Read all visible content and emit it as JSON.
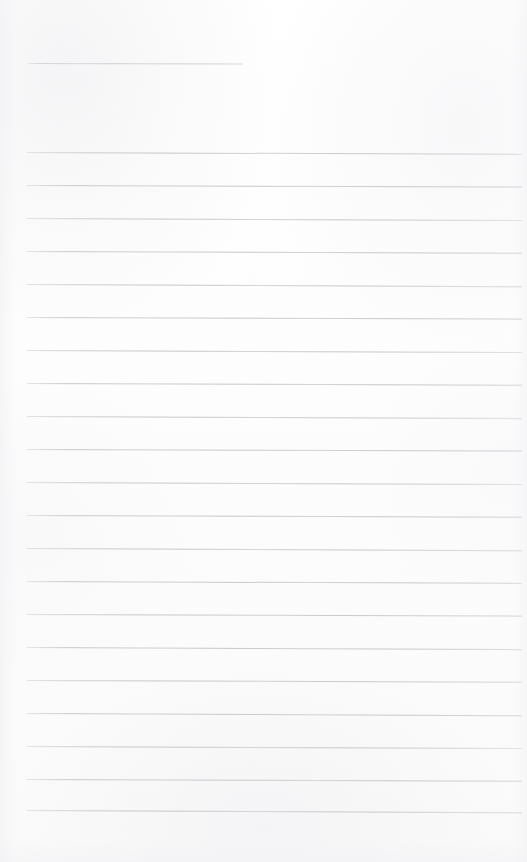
{
  "document": {
    "kind": "scanned-ruled-notepaper",
    "page_width": 527,
    "page_height": 862,
    "background_color": "#fdfdfd",
    "rule_color": "#c6c6cb",
    "text_content": "",
    "visible_text_lines": [],
    "notes": "Blank ruled page; no handwriting, printing, headings, numbers or marks of any kind are present."
  },
  "layout": {
    "left_margin_x": 27,
    "right_edge_x": 522,
    "first_rule_y": 152,
    "last_rule_y": 810,
    "rule_spacing": 32.9,
    "rule_thickness": 1,
    "top_blank_margin": 63,
    "bottom_blank_margin": 52
  },
  "rules": [
    {
      "id": "header-rule",
      "y": 63,
      "x": 27,
      "width": 216,
      "tilt": 0.1,
      "short": true
    },
    {
      "id": "rule-01",
      "y": 152,
      "x": 27,
      "width": 495,
      "tilt": 0.22
    },
    {
      "id": "rule-02",
      "y": 185,
      "x": 27,
      "width": 495,
      "tilt": 0.18
    },
    {
      "id": "rule-03",
      "y": 218,
      "x": 27,
      "width": 495,
      "tilt": 0.24
    },
    {
      "id": "rule-04",
      "y": 251,
      "x": 27,
      "width": 495,
      "tilt": 0.2
    },
    {
      "id": "rule-05",
      "y": 284,
      "x": 27,
      "width": 495,
      "tilt": 0.26
    },
    {
      "id": "rule-06",
      "y": 317,
      "x": 27,
      "width": 495,
      "tilt": 0.19
    },
    {
      "id": "rule-07",
      "y": 350,
      "x": 27,
      "width": 495,
      "tilt": 0.23
    },
    {
      "id": "rule-08",
      "y": 383,
      "x": 27,
      "width": 495,
      "tilt": 0.21
    },
    {
      "id": "rule-09",
      "y": 416,
      "x": 27,
      "width": 495,
      "tilt": 0.25
    },
    {
      "id": "rule-10",
      "y": 449,
      "x": 27,
      "width": 495,
      "tilt": 0.18
    },
    {
      "id": "rule-11",
      "y": 482,
      "x": 27,
      "width": 495,
      "tilt": 0.24
    },
    {
      "id": "rule-12",
      "y": 515,
      "x": 27,
      "width": 495,
      "tilt": 0.2
    },
    {
      "id": "rule-13",
      "y": 548,
      "x": 27,
      "width": 495,
      "tilt": 0.26
    },
    {
      "id": "rule-14",
      "y": 581,
      "x": 27,
      "width": 495,
      "tilt": 0.22
    },
    {
      "id": "rule-15",
      "y": 614,
      "x": 27,
      "width": 495,
      "tilt": 0.19
    },
    {
      "id": "rule-16",
      "y": 647,
      "x": 27,
      "width": 495,
      "tilt": 0.25
    },
    {
      "id": "rule-17",
      "y": 680,
      "x": 27,
      "width": 495,
      "tilt": 0.21
    },
    {
      "id": "rule-18",
      "y": 713,
      "x": 27,
      "width": 495,
      "tilt": 0.27
    },
    {
      "id": "rule-19",
      "y": 746,
      "x": 27,
      "width": 495,
      "tilt": 0.23
    },
    {
      "id": "rule-20",
      "y": 779,
      "x": 27,
      "width": 495,
      "tilt": 0.2
    },
    {
      "id": "rule-21",
      "y": 810,
      "x": 27,
      "width": 495,
      "tilt": 0.26
    }
  ]
}
